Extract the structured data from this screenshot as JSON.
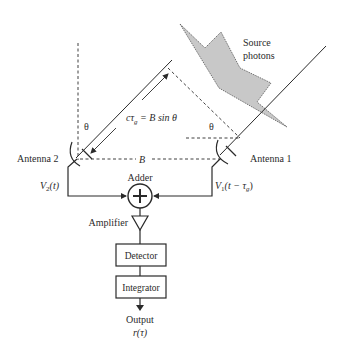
{
  "diagram": {
    "source_label_line1": "Source",
    "source_label_line2": "photons",
    "delay_equation": "cτ",
    "delay_sub": "g",
    "delay_rhs": " = B sin θ",
    "theta_left": "θ",
    "theta_right": "θ",
    "baseline_label": "B",
    "antenna2_label": "Antenna 2",
    "antenna1_label": "Antenna 1",
    "v2_label": "V",
    "v2_sub": "2",
    "v2_arg": "(t)",
    "v1_label": "V",
    "v1_sub": "1",
    "v1_arg": "(t − τ",
    "v1_arg_sub": "g",
    "v1_arg_close": ")",
    "adder_label": "Adder",
    "adder_symbol": "+",
    "amplifier_label": "Amplifier",
    "detector_label": "Detector",
    "integrator_label": "Integrator",
    "output_label": "Output",
    "output_fn": "r(τ)",
    "colors": {
      "line": "#2a2a2a",
      "photon_fill": "#c8c8c8"
    }
  }
}
